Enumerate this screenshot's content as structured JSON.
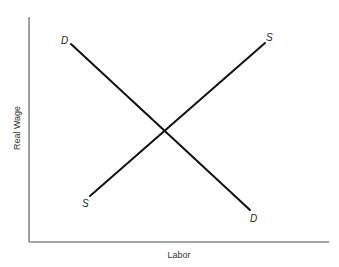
{
  "chart_data": {
    "type": "line",
    "title": "",
    "xlabel": "Labor",
    "ylabel": "Real Wage",
    "grid": false,
    "legend": "none (curves labeled directly at endpoints)",
    "axis_ticks": "none",
    "series": [
      {
        "name": "Demand",
        "label": "D",
        "slope": "downward",
        "start": {
          "x": 71,
          "y": 44,
          "label": "D"
        },
        "end": {
          "x": 250,
          "y": 210,
          "label": "D"
        }
      },
      {
        "name": "Supply",
        "label": "S",
        "slope": "upward",
        "start": {
          "x": 90,
          "y": 196,
          "label": "S"
        },
        "end": {
          "x": 265,
          "y": 43,
          "label": "S"
        }
      }
    ],
    "equilibrium": {
      "x": 165,
      "y": 130,
      "note": "intersection of D and S"
    }
  },
  "axes": {
    "x_label": "Labor",
    "y_label": "Real Wage"
  },
  "labels": {
    "demand_top": "D",
    "demand_bottom": "D",
    "supply_top": "S",
    "supply_bottom": "S"
  },
  "colors": {
    "curve": "#111111",
    "axis": "#8a8a8a",
    "text": "#222222",
    "background": "#ffffff"
  }
}
